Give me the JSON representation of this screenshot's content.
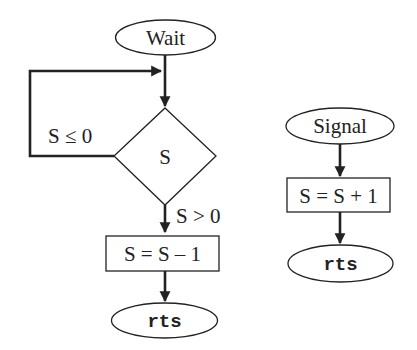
{
  "diagram": {
    "type": "flowchart",
    "colors": {
      "stroke": "#222222",
      "background": "#ffffff"
    },
    "wait_flow": {
      "start": "Wait",
      "decision": "S",
      "loop_condition": "S ≤ 0",
      "exit_condition": "S > 0",
      "action": "S = S – 1",
      "end": "rts"
    },
    "signal_flow": {
      "start": "Signal",
      "action": "S = S + 1",
      "end": "rts"
    }
  }
}
